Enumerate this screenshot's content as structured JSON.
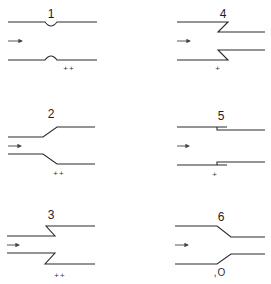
{
  "diagram": {
    "flow_arrow": "→",
    "panels": [
      {
        "id": "1",
        "label": "1",
        "geometry": "smooth-constriction (local bump)",
        "rating": "++"
      },
      {
        "id": "2",
        "label": "2",
        "geometry": "gradual-expansion",
        "rating": "++"
      },
      {
        "id": "3",
        "label": "3",
        "geometry": "re-entrant expansion (Z-step outward)",
        "rating": "++"
      },
      {
        "id": "4",
        "label": "4",
        "geometry": "re-entrant contraction (Z-step inward)",
        "rating": "+"
      },
      {
        "id": "5",
        "label": "5",
        "geometry": "small sudden contraction step",
        "rating": "+"
      },
      {
        "id": "6",
        "label": "6",
        "geometry": "gradual contraction",
        "rating": ",O"
      }
    ]
  }
}
